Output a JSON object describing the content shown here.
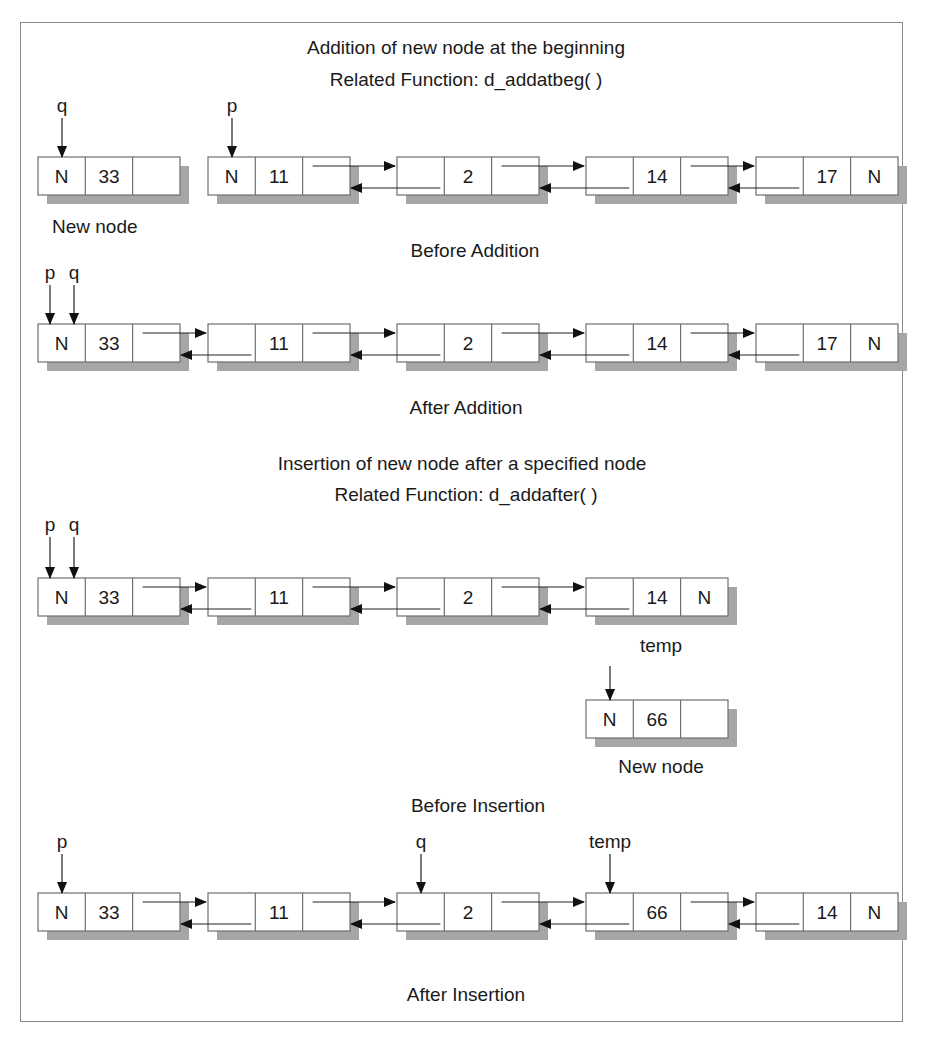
{
  "sections": [
    {
      "title": "Addition of new node at the beginning",
      "function": "Related Function: d_addatbeg( )",
      "before_caption": "Before Addition",
      "after_caption": "After Addition",
      "new_node_caption": "New node",
      "before": {
        "new_node": {
          "cells": [
            "N",
            "33",
            ""
          ],
          "pointer": "q"
        },
        "list": [
          {
            "cells": [
              "N",
              "11",
              ""
            ],
            "pointer": "p"
          },
          {
            "cells": [
              "",
              "2",
              ""
            ]
          },
          {
            "cells": [
              "",
              "14",
              ""
            ]
          },
          {
            "cells": [
              "",
              "17",
              "N"
            ]
          }
        ]
      },
      "after": {
        "pointers": [
          "p",
          "q"
        ],
        "list": [
          {
            "cells": [
              "N",
              "33",
              ""
            ]
          },
          {
            "cells": [
              "",
              "11",
              ""
            ]
          },
          {
            "cells": [
              "",
              "2",
              ""
            ]
          },
          {
            "cells": [
              "",
              "14",
              ""
            ]
          },
          {
            "cells": [
              "",
              "17",
              "N"
            ]
          }
        ]
      }
    },
    {
      "title": "Insertion of new node after a specified node",
      "function": "Related Function: d_addafter( )",
      "before_caption": "Before Insertion",
      "after_caption": "After Insertion",
      "new_node_caption": "New node",
      "before": {
        "pointers": [
          "p",
          "q"
        ],
        "list": [
          {
            "cells": [
              "N",
              "33",
              ""
            ]
          },
          {
            "cells": [
              "",
              "11",
              ""
            ]
          },
          {
            "cells": [
              "",
              "2",
              ""
            ]
          },
          {
            "cells": [
              "",
              "14",
              "N"
            ]
          }
        ],
        "temp_label": "temp",
        "new_node": {
          "cells": [
            "N",
            "66",
            ""
          ]
        }
      },
      "after": {
        "list": [
          {
            "cells": [
              "N",
              "33",
              ""
            ],
            "pointer": "p"
          },
          {
            "cells": [
              "",
              "11",
              ""
            ]
          },
          {
            "cells": [
              "",
              "2",
              ""
            ],
            "pointer": "q"
          },
          {
            "cells": [
              "",
              "66",
              ""
            ],
            "pointer": "temp"
          },
          {
            "cells": [
              "",
              "14",
              "N"
            ]
          }
        ]
      }
    }
  ],
  "colors": {
    "border": "#8a8a8a",
    "shadow": "#a6a6a6",
    "line": "#222222",
    "text": "#1a1a1a"
  }
}
